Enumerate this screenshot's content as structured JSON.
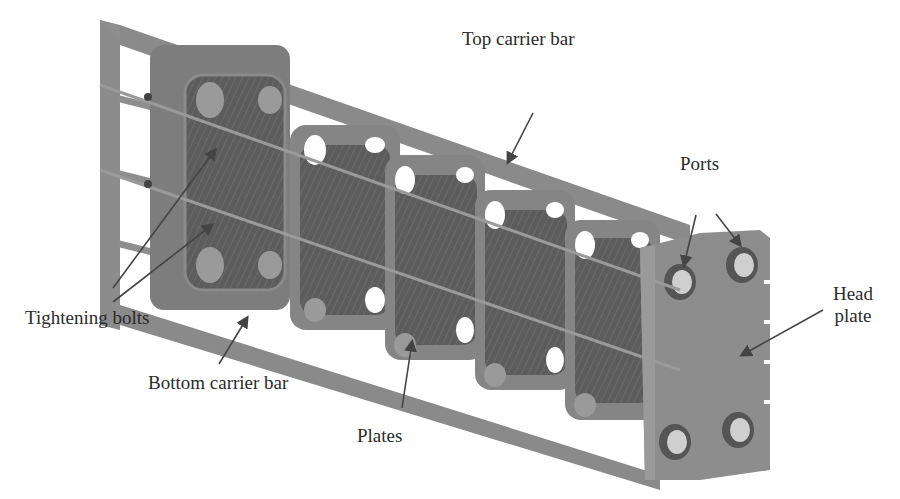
{
  "figure": {
    "colors": {
      "background": "#ffffff",
      "metal": "#8a8a8a",
      "metal_dark": "#6e6e6e",
      "plate_surface": "#5e5e5e",
      "rod": "#9a9a9a",
      "port_inner": "#cfcfcf",
      "arrow": "#444444",
      "text": "#2b2b2b"
    }
  },
  "labels": {
    "top_carrier_bar": "Top carrier bar",
    "ports": "Ports",
    "head_plate_line1": "Head",
    "head_plate_line2": "plate",
    "tightening_bolts": "Tightening bolts",
    "bottom_carrier_bar": "Bottom carrier bar",
    "plates": "Plates"
  }
}
